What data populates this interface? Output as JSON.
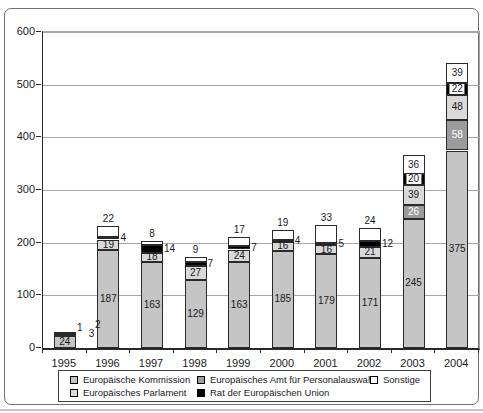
{
  "chart_data": {
    "type": "bar",
    "stacked": true,
    "title": "",
    "categories": [
      "1995",
      "1996",
      "1997",
      "1998",
      "1999",
      "2000",
      "2001",
      "2002",
      "2003",
      "2004"
    ],
    "series": [
      {
        "name": "Europäische Kommission",
        "color": "#c5c5c5",
        "label_color": "#1a1a1a",
        "values": [
          24,
          187,
          163,
          129,
          163,
          185,
          179,
          171,
          245,
          375
        ]
      },
      {
        "name": "Europäisches Amt für Personalauswahl",
        "color": "#9b9b9b",
        "label_color": "#ffffff",
        "values": [
          0,
          0,
          0,
          0,
          0,
          0,
          0,
          0,
          26,
          58
        ]
      },
      {
        "name": "Europäisches Parlament",
        "color": "#d9d9d9",
        "label_color": "#1a1a1a",
        "values": [
          1,
          19,
          18,
          27,
          24,
          16,
          16,
          21,
          39,
          48
        ]
      },
      {
        "name": "Rat der Europäischen Union",
        "color": "#000000",
        "label_color": "#1a1a1a",
        "values": [
          3,
          4,
          14,
          7,
          7,
          4,
          5,
          12,
          20,
          22
        ]
      },
      {
        "name": "Sonstige",
        "color": "#ffffff",
        "label_color": "#1a1a1a",
        "values": [
          2,
          22,
          8,
          9,
          17,
          19,
          33,
          24,
          36,
          39
        ]
      }
    ],
    "stack_order_bottom_to_top": [
      "Europäische Kommission",
      "Europäisches Amt für Personalauswahl",
      "Europäisches Parlament",
      "Rat der Europäischen Union",
      "Sonstige"
    ],
    "ylim": [
      0,
      600
    ],
    "yticks": [
      0,
      100,
      200,
      300,
      400,
      500,
      600
    ],
    "grid": true,
    "legend_position": "bottom",
    "legend_rows": [
      [
        "Europäische Kommission",
        "Europäisches Amt für Personalauswahl",
        "Sonstige"
      ],
      [
        "Europäisches Parlament",
        "Rat der Europäischen Union"
      ]
    ],
    "colors": {
      "grid": "#a6a6a6",
      "axis": "#2a2a2a",
      "text": "#1a1a1a"
    }
  }
}
